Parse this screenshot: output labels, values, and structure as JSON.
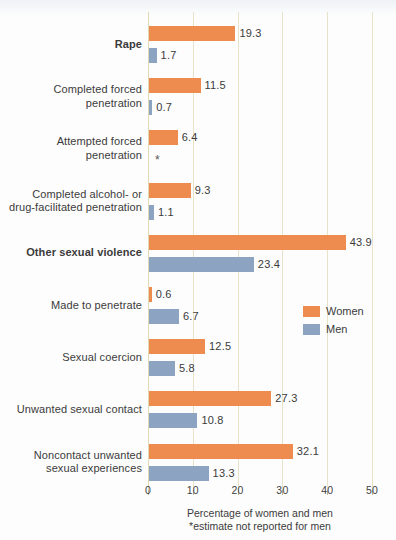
{
  "chart_data": {
    "type": "bar",
    "orientation": "horizontal",
    "title": "",
    "xlabel": "Percentage of women and men",
    "ylabel": "",
    "xlim": [
      0,
      50
    ],
    "xticks": [
      0,
      10,
      20,
      30,
      40,
      50
    ],
    "grid": true,
    "legend_position": "middle-right",
    "footnote": "*estimate not reported for men",
    "categories": [
      "Rape",
      "Completed forced penetration",
      "Attempted forced penetration",
      "Completed alcohol- or drug-facilitated penetration",
      "Other sexual violence",
      "Made to penetrate",
      "Sexual coercion",
      "Unwanted sexual contact",
      "Noncontact unwanted sexual experiences"
    ],
    "series": [
      {
        "name": "Women",
        "color": "#ee8b4f",
        "values": [
          19.3,
          11.5,
          6.4,
          9.3,
          43.9,
          0.6,
          12.5,
          27.3,
          32.1
        ]
      },
      {
        "name": "Men",
        "color": "#8ca4c2",
        "values": [
          1.7,
          0.7,
          null,
          1.1,
          23.4,
          6.7,
          5.8,
          10.8,
          13.3
        ]
      }
    ]
  },
  "axis": {
    "tick_labels": [
      "0",
      "10",
      "20",
      "30",
      "40",
      "50"
    ]
  },
  "rows": [
    {
      "label_line1": "Rape",
      "label_line2": "",
      "bold": true,
      "women_value": "19.3",
      "men_value": "1.7"
    },
    {
      "label_line1": "Completed forced",
      "label_line2": "penetration",
      "bold": false,
      "women_value": "11.5",
      "men_value": "0.7"
    },
    {
      "label_line1": "Attempted forced",
      "label_line2": "penetration",
      "bold": false,
      "women_value": "6.4",
      "men_value": "*"
    },
    {
      "label_line1": "Completed alcohol- or",
      "label_line2": "drug-facilitated penetration",
      "bold": false,
      "women_value": "9.3",
      "men_value": "1.1"
    },
    {
      "label_line1": "Other sexual violence",
      "label_line2": "",
      "bold": true,
      "women_value": "43.9",
      "men_value": "23.4"
    },
    {
      "label_line1": "Made to penetrate",
      "label_line2": "",
      "bold": false,
      "women_value": "0.6",
      "men_value": "6.7"
    },
    {
      "label_line1": "Sexual coercion",
      "label_line2": "",
      "bold": false,
      "women_value": "12.5",
      "men_value": "5.8"
    },
    {
      "label_line1": "Unwanted sexual contact",
      "label_line2": "",
      "bold": false,
      "women_value": "27.3",
      "men_value": "10.8"
    },
    {
      "label_line1": "Noncontact unwanted",
      "label_line2": "sexual experiences",
      "bold": false,
      "women_value": "32.1",
      "men_value": "13.3"
    }
  ],
  "legend": {
    "women_label": "Women",
    "men_label": "Men"
  },
  "caption": {
    "line1": "Percentage of women and men",
    "line2": "*estimate not reported for men"
  },
  "colors": {
    "women": "#ee8b4f",
    "men": "#8ca4c2",
    "gridline": "#e8e3c8",
    "background": "#fdfdfd",
    "text": "#3b3b3b"
  }
}
